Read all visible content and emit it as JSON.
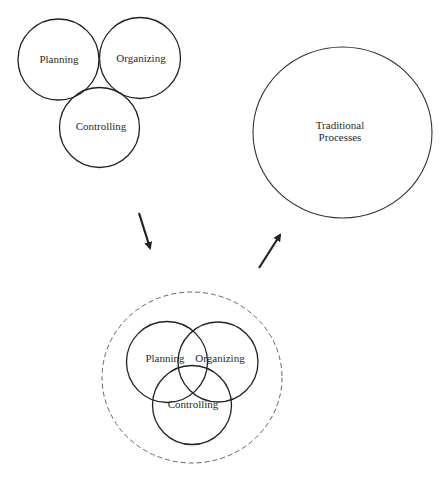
{
  "diagram": {
    "stroke_color": "#222222",
    "dashed_color": "#666666",
    "text_color": "#2a2a2a",
    "arrow_color": "#222222",
    "top_cluster": {
      "circles": [
        {
          "id": "planning",
          "label": "Planning",
          "cx": 58.5,
          "cy": 59.5,
          "r": 40.5,
          "label_x": 59,
          "label_y": 59
        },
        {
          "id": "organizing",
          "label": "Organizing",
          "cx": 140,
          "cy": 58,
          "r": 40.5,
          "label_x": 141,
          "label_y": 58
        },
        {
          "id": "controlling",
          "label": "Controlling",
          "cx": 99.5,
          "cy": 127.5,
          "r": 40,
          "label_x": 101,
          "label_y": 126
        }
      ]
    },
    "traditional": {
      "label_line1": "Traditional",
      "label_line2": "Processes",
      "cx": 342.5,
      "cy": 132.5,
      "rx": 89.5,
      "ry": 85.5,
      "label_x": 340,
      "label_y": 131
    },
    "arrows": [
      {
        "id": "arrow-down",
        "x1": 139,
        "y1": 213,
        "x2": 150,
        "y2": 248
      },
      {
        "id": "arrow-up",
        "x1": 259,
        "y1": 268,
        "x2": 280,
        "y2": 235
      }
    ],
    "bottom_cluster": {
      "boundary": {
        "cx": 192,
        "cy": 377.5,
        "rx": 90,
        "ry": 85.5,
        "dash": "5 3"
      },
      "circles": [
        {
          "id": "planning",
          "label": "Planning",
          "cx": 167,
          "cy": 362,
          "r": 40.5,
          "label_x": 165,
          "label_y": 358
        },
        {
          "id": "organizing",
          "label": "Organizing",
          "cx": 218,
          "cy": 362,
          "r": 40,
          "label_x": 220,
          "label_y": 358
        },
        {
          "id": "controlling",
          "label": "Controlling",
          "cx": 192,
          "cy": 405,
          "r": 39.5,
          "label_x": 193,
          "label_y": 404
        }
      ]
    }
  }
}
